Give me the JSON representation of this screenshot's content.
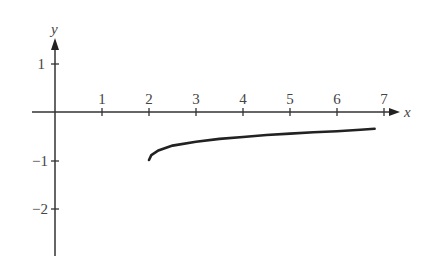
{
  "chart_data": {
    "type": "line",
    "title": "",
    "xlabel": "x",
    "ylabel": "y",
    "xlim": [
      -0.5,
      7.5
    ],
    "ylim": [
      -2.5,
      1.6
    ],
    "grid": false,
    "x_ticks": [
      "1",
      "2",
      "3",
      "4",
      "5",
      "6",
      "7"
    ],
    "y_ticks": [
      "1",
      "-1",
      "-2"
    ],
    "series": [
      {
        "name": "curve",
        "x": [
          2.0,
          2.05,
          2.2,
          2.5,
          3.0,
          3.5,
          4.0,
          4.5,
          5.0,
          5.5,
          6.0,
          6.5,
          6.8
        ],
        "y": [
          -1.0,
          -0.9,
          -0.8,
          -0.7,
          -0.62,
          -0.56,
          -0.52,
          -0.48,
          -0.45,
          -0.42,
          -0.4,
          -0.37,
          -0.35
        ]
      }
    ]
  },
  "axes": {
    "x_label": "x",
    "y_label": "y",
    "x_tick_labels": [
      "1",
      "2",
      "3",
      "4",
      "5",
      "6",
      "7"
    ],
    "y_tick_labels": {
      "pos1": "1",
      "neg1": "−1",
      "neg2": "−2"
    }
  }
}
